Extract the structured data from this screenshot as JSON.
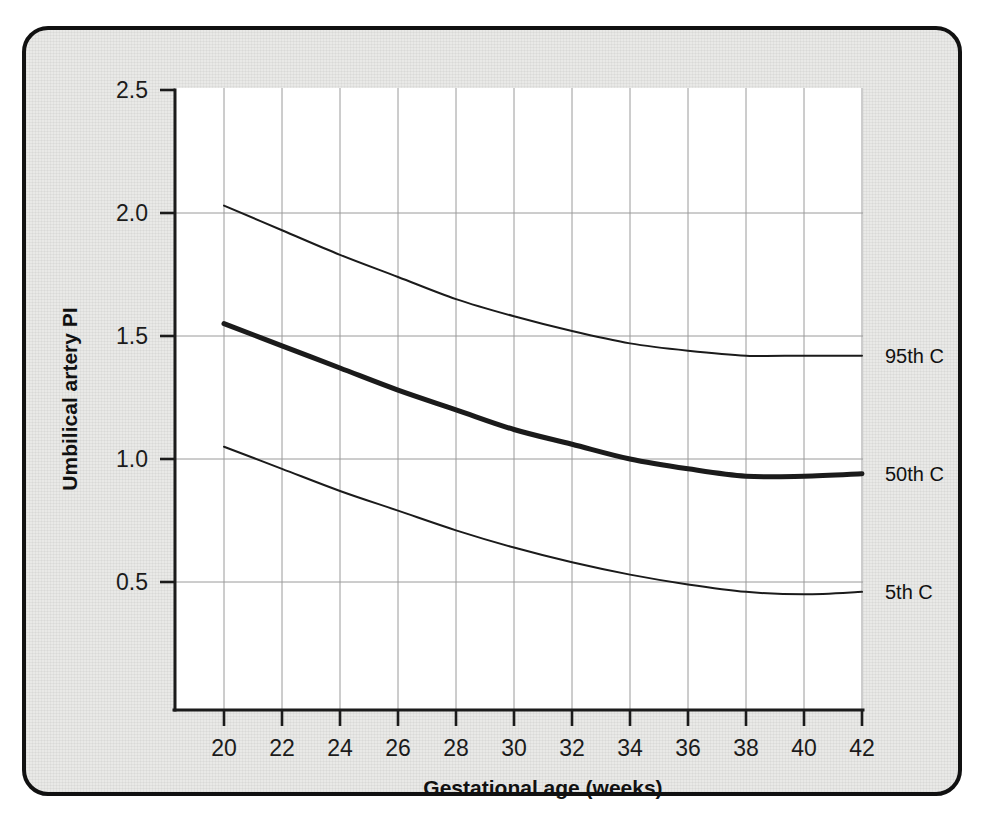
{
  "figure": {
    "frame_color": "#111111",
    "panel_color": "#e9e9e7",
    "plot_background": "#ffffff",
    "grid_color": "#9a9a9a",
    "ink_color": "#1b1b1b"
  },
  "chart_data": {
    "type": "line",
    "title": "",
    "xlabel": "Gestational age (weeks)",
    "ylabel": "Umbilical artery PI",
    "xlim": [
      19,
      42
    ],
    "ylim": [
      0.0,
      2.5
    ],
    "xticks": [
      20,
      22,
      24,
      26,
      28,
      30,
      32,
      34,
      36,
      38,
      40,
      42
    ],
    "xtick_labels": [
      "20",
      "22",
      "24",
      "26",
      "28",
      "30",
      "32",
      "34",
      "36",
      "38",
      "40",
      "42"
    ],
    "yticks": [
      0.5,
      1.0,
      1.5,
      2.0,
      2.5
    ],
    "ytick_labels": [
      "0.5",
      "1.0",
      "1.5",
      "2.0",
      "2.5"
    ],
    "grid": "both",
    "legend_position": "right-of-axes (inline series labels)",
    "x": [
      20,
      22,
      24,
      26,
      28,
      30,
      32,
      34,
      36,
      38,
      40,
      42
    ],
    "series": [
      {
        "name": "95th C",
        "label": "95th C",
        "style": "thin",
        "values": [
          2.03,
          1.93,
          1.83,
          1.74,
          1.65,
          1.58,
          1.52,
          1.47,
          1.44,
          1.42,
          1.42,
          1.42
        ]
      },
      {
        "name": "50th C",
        "label": "50th C",
        "style": "thick",
        "values": [
          1.55,
          1.46,
          1.37,
          1.28,
          1.2,
          1.12,
          1.06,
          1.0,
          0.96,
          0.93,
          0.93,
          0.94
        ]
      },
      {
        "name": "5th C",
        "label": "5th C",
        "style": "thin",
        "values": [
          1.05,
          0.96,
          0.87,
          0.79,
          0.71,
          0.64,
          0.58,
          0.53,
          0.49,
          0.46,
          0.45,
          0.46
        ]
      }
    ]
  }
}
